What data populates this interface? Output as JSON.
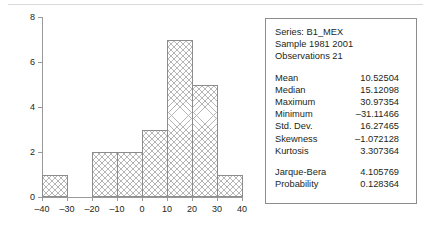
{
  "chart_data": {
    "type": "bar",
    "title": "",
    "xlabel": "",
    "ylabel": "",
    "categories": [
      "-40 to -30",
      "-30 to -20",
      "-20 to -10",
      "-10 to 0",
      "0 to 10",
      "10 to 20",
      "20 to 30",
      "30 to 40"
    ],
    "bin_edges": [
      -40,
      -30,
      -20,
      -10,
      0,
      10,
      20,
      30,
      40
    ],
    "values": [
      1,
      0,
      2,
      2,
      3,
      7,
      5,
      1
    ],
    "xlim": [
      -40,
      40
    ],
    "ylim": [
      0,
      8
    ],
    "xticks": [
      "–40",
      "–30",
      "–20",
      "–10",
      "0",
      "10",
      "20",
      "30",
      "40"
    ],
    "xtick_values": [
      -40,
      -30,
      -20,
      -10,
      0,
      10,
      20,
      30,
      40
    ],
    "yticks": [
      "0",
      "2",
      "4",
      "6",
      "8"
    ],
    "ytick_values": [
      0,
      2,
      4,
      6,
      8
    ],
    "grid": false,
    "legend": "none",
    "bar_fill": "crosshatch-gray",
    "bar_edge_color": "#8c8c8c"
  },
  "stats_panel": {
    "series_line": "Series: B1_MEX",
    "sample_line": "Sample 1981 2001",
    "observations_line": "Observations 21",
    "rows": [
      {
        "key": "Mean",
        "value": "10.52504"
      },
      {
        "key": "Median",
        "value": "15.12098"
      },
      {
        "key": "Maximum",
        "value": "30.97354"
      },
      {
        "key": "Minimum",
        "value": "–31.11466"
      },
      {
        "key": "Std. Dev.",
        "value": "16.27465"
      },
      {
        "key": "Skewness",
        "value": "–1.072128"
      },
      {
        "key": "Kurtosis",
        "value": "3.307364"
      }
    ],
    "test_rows": [
      {
        "key": "Jarque-Bera",
        "value": "4.105769"
      },
      {
        "key": "Probability",
        "value": "0.128364"
      }
    ]
  }
}
